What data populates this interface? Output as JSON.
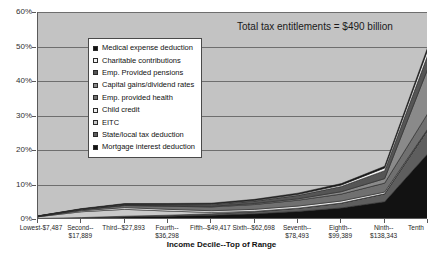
{
  "annotation": "Total tax entitlements = $490 billion",
  "axis": {
    "x_title": "Income Decile--Top of Range",
    "y_ticks": [
      "0%",
      "10%",
      "20%",
      "30%",
      "40%",
      "50%",
      "60%"
    ],
    "x_ticks": [
      "Lowest-$7,487",
      "Second--\n$17,889",
      "Third--$27,893",
      "Fourth--\n$36,298",
      "Fifth--$49,417",
      "Sixth--$62,698",
      "Seventh--\n$78,493",
      "Eighth--\n$99,389",
      "Ninth--\n$138,343",
      "Tenth"
    ]
  },
  "legend": {
    "items": [
      {
        "label": "Medical expense deduction",
        "swatch_icon": "square-swatch-icon",
        "color": "#111111"
      },
      {
        "label": "Charitable contributions",
        "swatch_icon": "square-swatch-icon",
        "color": "#f2f2f2"
      },
      {
        "label": "Emp. Provided pensions",
        "swatch_icon": "square-swatch-icon",
        "color": "#555555"
      },
      {
        "label": "Capital gains/dividend rates",
        "swatch_icon": "square-swatch-icon",
        "color": "#8a8a8a"
      },
      {
        "label": "Emp. provided health",
        "swatch_icon": "square-swatch-icon",
        "color": "#707070"
      },
      {
        "label": "Child credit",
        "swatch_icon": "square-swatch-icon",
        "color": "#ededed"
      },
      {
        "label": "EITC",
        "swatch_icon": "square-swatch-icon",
        "color": "#c9c9c9"
      },
      {
        "label": "State/local tax deduction",
        "swatch_icon": "square-swatch-icon",
        "color": "#5e5e5e"
      },
      {
        "label": "Mortgage interest deduction",
        "swatch_icon": "square-swatch-icon",
        "color": "#121212"
      }
    ]
  },
  "chart_data": {
    "type": "area",
    "title": "",
    "subtitle": "Total tax entitlements = $490 billion",
    "xlabel": "Income Decile--Top of Range",
    "ylabel": "",
    "ylim": [
      0,
      60
    ],
    "ytick_step": 10,
    "grid": true,
    "stacked": true,
    "legend_position": "inside-upper-left",
    "categories": [
      "Lowest-$7,487",
      "Second--$17,889",
      "Third--$27,893",
      "Fourth--$36,298",
      "Fifth--$49,417",
      "Sixth--$62,698",
      "Seventh--$78,493",
      "Eighth--$99,389",
      "Ninth--$138,343",
      "Tenth"
    ],
    "series": [
      {
        "name": "Mortgage interest deduction",
        "color": "#121212",
        "values": [
          0.1,
          0.3,
          0.6,
          0.8,
          1.1,
          1.5,
          2.2,
          3.2,
          5.0,
          19.0
        ]
      },
      {
        "name": "State/local tax deduction",
        "color": "#5e5e5e",
        "values": [
          0.05,
          0.1,
          0.2,
          0.3,
          0.4,
          0.6,
          0.9,
          1.4,
          2.3,
          7.0
        ]
      },
      {
        "name": "EITC",
        "color": "#c9c9c9",
        "values": [
          0.5,
          1.7,
          2.0,
          1.2,
          0.4,
          0.15,
          0.05,
          0.02,
          0.0,
          0.0
        ]
      },
      {
        "name": "Child credit",
        "color": "#ededed",
        "values": [
          0.05,
          0.3,
          0.5,
          0.5,
          0.5,
          0.55,
          0.6,
          0.6,
          0.5,
          0.2
        ]
      },
      {
        "name": "Emp. provided health",
        "color": "#707070",
        "values": [
          0.1,
          0.3,
          0.6,
          0.9,
          1.1,
          1.4,
          1.7,
          2.0,
          2.6,
          4.5
        ]
      },
      {
        "name": "Capital gains/dividend rates",
        "color": "#8a8a8a",
        "values": [
          0.02,
          0.05,
          0.1,
          0.15,
          0.2,
          0.3,
          0.4,
          0.7,
          1.3,
          13.0
        ]
      },
      {
        "name": "Emp. Provided pensions",
        "color": "#555555",
        "values": [
          0.03,
          0.1,
          0.2,
          0.3,
          0.5,
          0.7,
          1.0,
          1.5,
          2.3,
          4.0
        ]
      },
      {
        "name": "Charitable contributions",
        "color": "#f2f2f2",
        "values": [
          0.02,
          0.05,
          0.08,
          0.1,
          0.15,
          0.2,
          0.3,
          0.45,
          0.8,
          1.6
        ]
      },
      {
        "name": "Medical expense deduction",
        "color": "#111111",
        "values": [
          0.03,
          0.1,
          0.2,
          0.25,
          0.25,
          0.3,
          0.35,
          0.4,
          0.5,
          0.7
        ]
      }
    ],
    "totals": [
      0.9,
      3.0,
      4.5,
      4.5,
      4.6,
      5.7,
      7.5,
      10.3,
      15.3,
      50.0
    ]
  }
}
